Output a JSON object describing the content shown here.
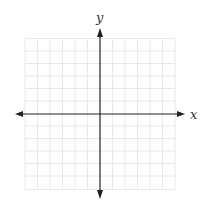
{
  "diagram": {
    "type": "coordinate-grid",
    "x_axis_label": "x",
    "y_axis_label": "y",
    "grid": {
      "cells_x": 12,
      "cells_y": 12,
      "cell_size_px": 12.5
    },
    "colors": {
      "grid": "#e2e2e2",
      "axis": "#222222",
      "label": "#333333"
    }
  }
}
